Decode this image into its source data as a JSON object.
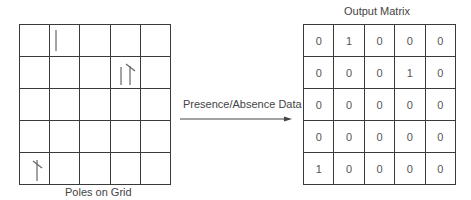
{
  "left_panel": {
    "caption": "Poles on Grid",
    "rows": 5,
    "cols": 5,
    "poles": [
      {
        "row": 0,
        "col": 1,
        "type": "single-pole-icon"
      },
      {
        "row": 1,
        "col": 3,
        "type": "double-pole-icon"
      },
      {
        "row": 4,
        "col": 0,
        "type": "crossarm-pole-icon"
      }
    ]
  },
  "arrow": {
    "label": "Presence/Absence Data"
  },
  "right_panel": {
    "title": "Output Matrix",
    "matrix": [
      [
        "0",
        "1",
        "0",
        "0",
        "0"
      ],
      [
        "0",
        "0",
        "0",
        "1",
        "0"
      ],
      [
        "0",
        "0",
        "0",
        "0",
        "0"
      ],
      [
        "0",
        "0",
        "0",
        "0",
        "0"
      ],
      [
        "1",
        "0",
        "0",
        "0",
        "0"
      ]
    ]
  }
}
